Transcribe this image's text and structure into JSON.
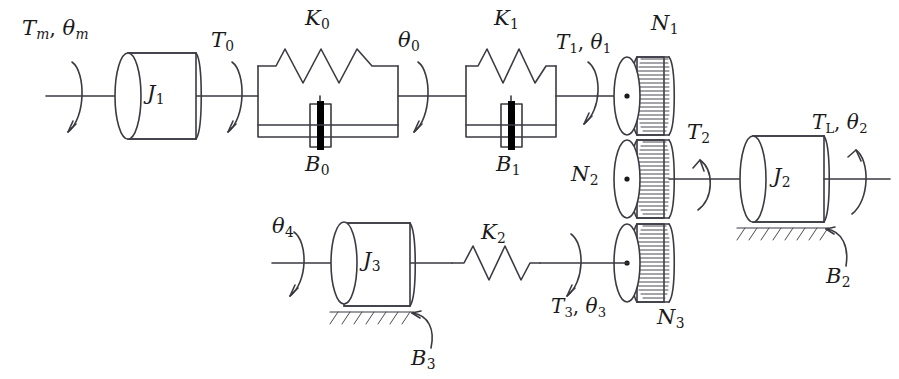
{
  "diagram": {
    "type": "mechanical-schematic",
    "stroke_color": "#3a3a42",
    "fill_color": "#ffffff",
    "text_color": "#1a1a1a",
    "damper_bar_color": "#000000"
  },
  "labels": {
    "input_torque": {
      "base": "T",
      "sub": "m",
      "base2": "θ",
      "sub2": "m",
      "text": "T_m, θ_m"
    },
    "inertia_1": {
      "base": "J",
      "sub": "1",
      "text": "J_1"
    },
    "torque_0": {
      "base": "T",
      "sub": "0",
      "text": "T_0"
    },
    "spring_0": {
      "base": "K",
      "sub": "0",
      "text": "K_0"
    },
    "damper_0": {
      "base": "B",
      "sub": "0",
      "text": "B_0"
    },
    "theta_0": {
      "base": "θ",
      "sub": "0",
      "text": "θ_0"
    },
    "spring_1": {
      "base": "K",
      "sub": "1",
      "text": "K_1"
    },
    "damper_1": {
      "base": "B",
      "sub": "1",
      "text": "B_1"
    },
    "torque_1": {
      "base": "T",
      "sub": "1",
      "base2": "θ",
      "sub2": "1",
      "text": "T_1, θ_1"
    },
    "gear_1": {
      "base": "N",
      "sub": "1",
      "text": "N_1"
    },
    "gear_2": {
      "base": "N",
      "sub": "2",
      "text": "N_2"
    },
    "gear_3": {
      "base": "N",
      "sub": "3",
      "text": "N_3"
    },
    "torque_2": {
      "base": "T",
      "sub": "2",
      "text": "T_2"
    },
    "inertia_2": {
      "base": "J",
      "sub": "2",
      "text": "J_2"
    },
    "load_torque": {
      "base": "T",
      "sub": "L",
      "base2": "θ",
      "sub2": "2",
      "text": "T_L, θ_2"
    },
    "damper_2": {
      "base": "B",
      "sub": "2",
      "text": "B_2"
    },
    "theta_4": {
      "base": "θ",
      "sub": "4",
      "text": "θ_4"
    },
    "inertia_3": {
      "base": "J",
      "sub": "3",
      "text": "J_3"
    },
    "damper_3": {
      "base": "B",
      "sub": "3",
      "text": "B_3"
    },
    "spring_2": {
      "base": "K",
      "sub": "2",
      "text": "K_2"
    },
    "torque_3": {
      "base": "T",
      "sub": "3",
      "base2": "θ",
      "sub2": "3",
      "text": "T_3, θ_3"
    }
  }
}
